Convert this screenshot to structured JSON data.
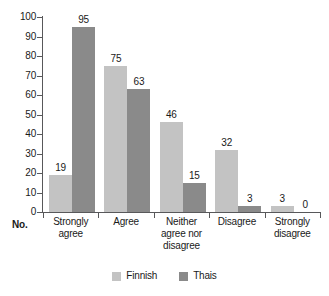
{
  "chart_data": {
    "type": "bar",
    "title": "",
    "subtitle": "",
    "xlabel": "No.",
    "ylabel": "",
    "categories": [
      "Strongly agree",
      "Agree",
      "Neither agree nor disagree",
      "Disagree",
      "Strongly disagree"
    ],
    "category_lines": [
      [
        "Strongly",
        "agree"
      ],
      [
        "Agree"
      ],
      [
        "Neither",
        "agree nor",
        "disagree"
      ],
      [
        "Disagree"
      ],
      [
        "Strongly",
        "disagree"
      ]
    ],
    "series": [
      {
        "name": "Finnish",
        "color": "#c3c3c3",
        "values": [
          19,
          75,
          46,
          32,
          3
        ]
      },
      {
        "name": "Thais",
        "color": "#8a8a8a",
        "values": [
          95,
          63,
          15,
          3,
          0
        ]
      }
    ],
    "ylim": [
      0,
      100
    ],
    "yticks": [
      0,
      10,
      20,
      30,
      40,
      50,
      60,
      70,
      80,
      90,
      100
    ],
    "ytick_labels": [
      "0",
      "10",
      "20",
      "30",
      "40",
      "50",
      "60",
      "70",
      "80",
      "90",
      "100"
    ],
    "grid": false,
    "legend_position": "bottom",
    "data_labels": true,
    "axis_color": "#58585a",
    "background": "#ffffff"
  },
  "legend": {
    "items": [
      {
        "label": "Finnish",
        "color": "#c3c3c3"
      },
      {
        "label": "Thais",
        "color": "#8a8a8a"
      }
    ]
  },
  "axis": {
    "no_label": "No."
  }
}
